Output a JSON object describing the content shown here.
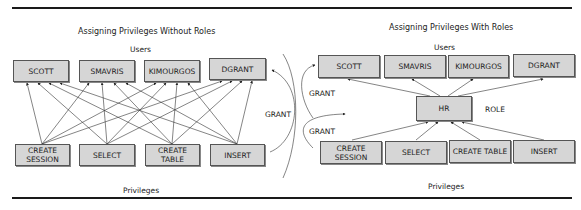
{
  "left_diagram": {
    "title": "Assigning Privileges Without Roles",
    "users_label": "Users",
    "privileges_label": "Privileges",
    "users": [
      "SCOTT",
      "SMAVRIS",
      "KIMOURGOS",
      "DGRANT"
    ],
    "privileges": [
      "CREATE SESSION",
      "SELECT",
      "CREATE TABLE",
      "INSERT"
    ]
  },
  "right_diagram": {
    "title": "Assigning Privileges With Roles",
    "users_label": "Users",
    "privileges_label": "Privileges",
    "role_name": "HR",
    "role_label": "ROLE",
    "users": [
      "SCOTT",
      "SMAVRIS",
      "KIMOURGOS",
      "DGRANT"
    ],
    "privileges": [
      "CREATE SESSION",
      "SELECT",
      "CREATE TABLE",
      "INSERT"
    ]
  },
  "grant_labels": {
    "left": "GRANT",
    "right_top": "GRANT",
    "right_bottom": "GRANT"
  }
}
